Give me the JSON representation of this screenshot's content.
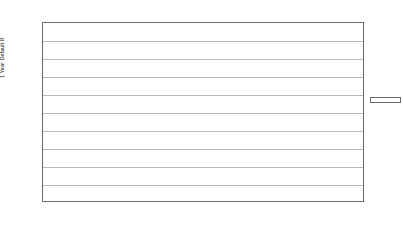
{
  "chart": {
    "type": "line",
    "title": "",
    "ylabel": "1 Year Default R",
    "xlabel": "",
    "ylim": [
      0,
      50
    ],
    "ytick_step": 5,
    "ytick_labels": [
      "50.00",
      "45.00",
      "40.00",
      "35.00",
      "30.00",
      "25.00",
      "20.00",
      "15.00",
      "10.00",
      "5.00",
      "0.00"
    ],
    "grid": true,
    "legend_position": "right"
  },
  "chart_data": {
    "type": "line",
    "title": "",
    "xlabel": "",
    "ylabel": "1 Year Default R",
    "ylim": [
      0,
      50
    ],
    "ytick_step": 5,
    "grid": true,
    "legend_position": "right",
    "categories": [
      "1981",
      "1982",
      "1983",
      "1984",
      "1985",
      "1986",
      "1987",
      "1988",
      "1989",
      "1990",
      "1991",
      "1992",
      "1993",
      "1994",
      "1995",
      "1996",
      "1997",
      "1998",
      "1999",
      "2000",
      "2001",
      "2002"
    ],
    "xtick_labels": [
      "1981",
      "1982",
      "1983",
      "1984",
      "1985",
      "1986",
      "1987",
      "1988",
      "1989",
      "1990",
      "1991",
      "1992",
      "1993",
      "1994",
      "1995",
      "1996",
      "1997",
      "1998",
      "",
      "2000",
      "2001",
      "2002"
    ],
    "series": [
      {
        "name": "BBB",
        "color": "#3f3f3f",
        "values": [
          0.0,
          0.3,
          0.4,
          0.7,
          0.0,
          0.3,
          0.0,
          0.0,
          0.6,
          0.6,
          0.5,
          0.0,
          0.0,
          0.3,
          0.2,
          0.1,
          0.3,
          0.4,
          0.2,
          0.4,
          0.4,
          1.0
        ]
      },
      {
        "name": "BB",
        "color": "#bdbdbd",
        "values": [
          0.0,
          4.2,
          1.2,
          1.6,
          1.5,
          1.3,
          0.4,
          1.1,
          0.8,
          3.6,
          1.1,
          0.0,
          0.7,
          0.2,
          0.9,
          0.5,
          0.2,
          0.8,
          0.9,
          1.0,
          3.1,
          2.9
        ]
      },
      {
        "name": "B",
        "color": "#8f8f8f",
        "values": [
          0.0,
          2.5,
          3.0,
          3.9,
          4.2,
          7.9,
          5.1,
          3.4,
          3.4,
          4.0,
          13.3,
          9.8,
          5.0,
          3.6,
          4.6,
          3.8,
          3.4,
          5.0,
          6.6,
          7.7,
          10.5,
          8.4
        ]
      },
      {
        "name": "CCC",
        "color": "#555555",
        "values": [
          0.0,
          23.0,
          0.0,
          15.7,
          11.1,
          17.5,
          9.6,
          29.0,
          30.9,
          31.7,
          21.4,
          12.4,
          15.0,
          24.0,
          8.0,
          3.7,
          14.8,
          29.2,
          30.1,
          38.5,
          43.3,
          43.6
        ]
      }
    ]
  },
  "legend": {
    "items": [
      {
        "label": "BBB"
      },
      {
        "label": "BB"
      },
      {
        "label": "B"
      },
      {
        "label": "CCC"
      }
    ]
  }
}
